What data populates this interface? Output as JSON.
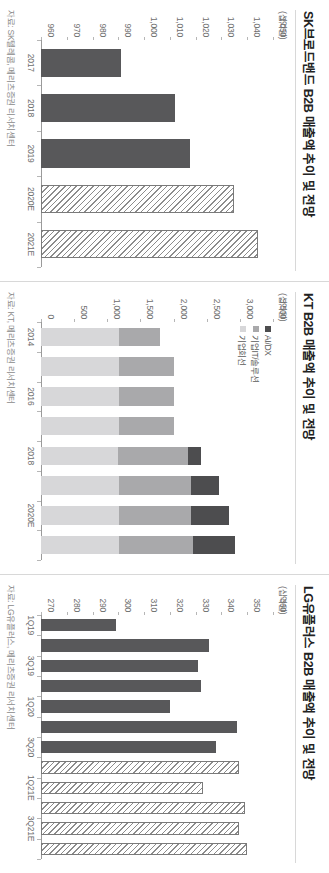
{
  "figure": {
    "orientation_deg": 90,
    "panel_count": 3
  },
  "panels": [
    {
      "id": "lgu",
      "title": "LG유플러스 B2B 매출액 추이 및 전망",
      "unit": "(십억원)",
      "source": "자료: LG유플러스, 메리츠증권 리서치센터",
      "legend": []
    },
    {
      "id": "kt",
      "title": "KT B2B 매출액 추이 및 전망",
      "unit": "(십억원)",
      "source": "자료: KT, 메리츠증권 리서치센터",
      "legend": [
        {
          "key": "ai",
          "label": "AI/DX",
          "color": "#4d4d4f"
        },
        {
          "key": "it",
          "label": "기업IT/솔루션",
          "color": "#a9a9ab"
        },
        {
          "key": "line",
          "label": "기업회선",
          "color": "#d7d7d9"
        }
      ]
    },
    {
      "id": "skb",
      "title": "SK브로드밴드 B2B 매출액 추이 및 전망",
      "unit": "(십억원)",
      "source": "자료: SK텔레콤, 메리츠증권 리서치센터",
      "legend": []
    }
  ],
  "chart_data": [
    {
      "id": "lgu",
      "type": "bar",
      "title": "LG유플러스 B2B 매출액 추이 및 전망",
      "xlabel": "",
      "ylabel": "(십억원)",
      "ylim": [
        270,
        360
      ],
      "yticks": [
        270,
        280,
        290,
        300,
        310,
        320,
        330,
        340,
        350,
        360
      ],
      "ytick_labels": [
        "270",
        "280",
        "290",
        "300",
        "310",
        "320",
        "330",
        "340",
        "350",
        "360"
      ],
      "grid": false,
      "legend_position": "none",
      "categories": [
        "1Q19",
        "2Q19",
        "3Q19",
        "4Q19",
        "1Q20",
        "2Q20",
        "3Q20",
        "4Q20",
        "1Q21E",
        "2Q21E",
        "3Q21E",
        "4Q21E"
      ],
      "tick_labels_shown": [
        "1Q19",
        "3Q19",
        "1Q20",
        "3Q20",
        "1Q21E",
        "3Q21E"
      ],
      "values": [
        299,
        335,
        331,
        332,
        320,
        346,
        338,
        347,
        333,
        349,
        347,
        350
      ],
      "series": [
        {
          "name": "실적",
          "style": "solid",
          "color": "#58585a",
          "values": [
            299,
            335,
            331,
            332,
            320,
            346,
            338,
            null,
            null,
            null,
            null,
            null
          ]
        },
        {
          "name": "전망",
          "style": "hatched",
          "color": "#ffffff",
          "values": [
            null,
            null,
            null,
            null,
            null,
            null,
            null,
            347,
            333,
            349,
            347,
            350
          ]
        }
      ]
    },
    {
      "id": "kt",
      "type": "bar",
      "subtype": "stacked",
      "title": "KT B2B 매출액 추이 및 전망",
      "xlabel": "",
      "ylabel": "(십억원)",
      "ylim": [
        0,
        3500
      ],
      "yticks": [
        0,
        500,
        1000,
        1500,
        2000,
        2500,
        3000,
        3500
      ],
      "ytick_labels": [
        "0",
        "500",
        "1,000",
        "1,500",
        "2,000",
        "2,500",
        "3,000",
        "3,500"
      ],
      "grid": false,
      "legend_position": "upper-left",
      "categories": [
        "2014",
        "2015",
        "2016",
        "2017",
        "2018",
        "2019",
        "2020E",
        "2021E"
      ],
      "tick_labels_shown": [
        "2014",
        "2016",
        "2018",
        "2020E"
      ],
      "series": [
        {
          "name": "기업회선",
          "color": "#d7d7d9",
          "values": [
            1170,
            1180,
            1180,
            1170,
            1160,
            1180,
            1180,
            1180
          ]
        },
        {
          "name": "기업IT/솔루션",
          "color": "#a9a9ab",
          "values": [
            620,
            830,
            830,
            830,
            1060,
            1080,
            1090,
            1110
          ]
        },
        {
          "name": "AI/DX",
          "color": "#4d4d4f",
          "values": [
            0,
            0,
            0,
            0,
            190,
            430,
            570,
            640
          ]
        }
      ],
      "totals": [
        1790,
        2010,
        2010,
        2000,
        2410,
        2690,
        2840,
        2930
      ]
    },
    {
      "id": "skb",
      "type": "bar",
      "title": "SK브로드밴드 B2B 매출액 추이 및 전망",
      "xlabel": "",
      "ylabel": "(십억원)",
      "ylim": [
        960,
        1050
      ],
      "yticks": [
        960,
        970,
        980,
        990,
        1000,
        1010,
        1020,
        1030,
        1040,
        1050
      ],
      "ytick_labels": [
        "960",
        "970",
        "980",
        "990",
        "1,000",
        "1,010",
        "1,020",
        "1,030",
        "1,040",
        "1,050"
      ],
      "grid": false,
      "legend_position": "none",
      "categories": [
        "2017",
        "2018",
        "2019",
        "2020E",
        "2021E"
      ],
      "tick_labels_shown": [
        "2017",
        "2018",
        "2019",
        "2020E",
        "2021E"
      ],
      "values": [
        991,
        1012,
        1018,
        1035,
        1044
      ],
      "series": [
        {
          "name": "실적",
          "style": "solid",
          "color": "#58585a",
          "values": [
            991,
            1012,
            1018,
            null,
            null
          ]
        },
        {
          "name": "전망",
          "style": "hatched",
          "color": "#ffffff",
          "values": [
            null,
            null,
            null,
            1035,
            1044
          ]
        }
      ]
    }
  ]
}
